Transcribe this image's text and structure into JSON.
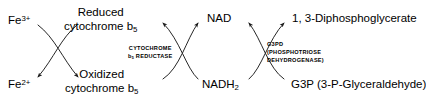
{
  "diagram": {
    "type": "biochemical-pathway",
    "background_color": "#ffffff",
    "stroke_color": "#1a1a1a",
    "text_color": "#000000"
  },
  "labels": {
    "fe3": "Fe",
    "fe3_charge": "3+",
    "fe2": "Fe",
    "fe2_charge": "2+",
    "reduced_cyt_line1": "Reduced",
    "reduced_cyt_line2": "cytochrome b",
    "reduced_cyt_sub": "5",
    "oxidized_cyt_line1": "Oxidized",
    "oxidized_cyt_line2": "cytochrome b",
    "oxidized_cyt_sub": "5",
    "nad": "NAD",
    "nadh2": "NADH",
    "nadh2_sub": "2",
    "dpg": "1, 3-Diphosphoglycerate",
    "g3p": "G3P (3-P-Glyceraldehyde)"
  },
  "enzymes": {
    "cytochrome_reductase_line1": "CYTOCHROME",
    "cytochrome_reductase_line2_pre": "b",
    "cytochrome_reductase_line2_sub": "5",
    "cytochrome_reductase_line2_post": "REDUCTASE",
    "g3pd_line1": "G3PD",
    "g3pd_line2": "(PHOSPHOTRIOSE",
    "g3pd_line3": "DEHYDROGENASE)"
  },
  "reactions": [
    {
      "name": "cytochrome-b5-reductase-couple",
      "left_top": "Fe3+",
      "left_bottom": "Fe2+",
      "right_top": "Reduced cytochrome b5",
      "right_bottom": "Oxidized cytochrome b5",
      "enzyme": "CYTOCHROME b5 REDUCTASE"
    },
    {
      "name": "nad-nadh-couple",
      "left_top": "Reduced cytochrome b5",
      "left_bottom": "Oxidized cytochrome b5",
      "right_top": "NAD",
      "right_bottom": "NADH2",
      "enzyme": "CYTOCHROME b5 REDUCTASE"
    },
    {
      "name": "g3pd-couple",
      "left_top": "NAD",
      "left_bottom": "NADH2",
      "right_top": "1, 3-Diphosphoglycerate",
      "right_bottom": "G3P (3-P-Glyceraldehyde)",
      "enzyme": "G3PD (PHOSPHOTRIOSE DEHYDROGENASE)"
    }
  ]
}
